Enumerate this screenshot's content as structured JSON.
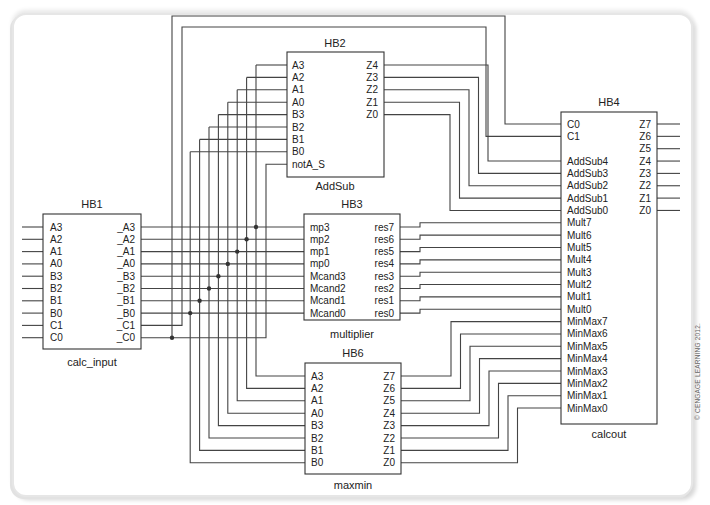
{
  "header": {
    "figure_title": "FIGURE 13-1 Final Schematic"
  },
  "copyright": "© CENGAGE LEARNING 2012.",
  "blocks": {
    "hb1": {
      "id": "HB1",
      "name": "calc_input",
      "inputs": [
        "A3",
        "A2",
        "A1",
        "A0",
        "B3",
        "B2",
        "B1",
        "B0",
        "C1",
        "C0"
      ],
      "outputs": [
        "_A3",
        "_A2",
        "_A1",
        "_A0",
        "_B3",
        "_B2",
        "_B1",
        "_B0",
        "_C1",
        "_C0"
      ]
    },
    "hb2": {
      "id": "HB2",
      "name": "AddSub",
      "inputs": [
        "A3",
        "A2",
        "A1",
        "A0",
        "B3",
        "B2",
        "B1",
        "B0",
        "notA_S"
      ],
      "outputs": [
        "Z4",
        "Z3",
        "Z2",
        "Z1",
        "Z0"
      ]
    },
    "hb3": {
      "id": "HB3",
      "name": "multiplier",
      "inputs": [
        "mp3",
        "mp2",
        "mp1",
        "mp0",
        "Mcand3",
        "Mcand2",
        "Mcand1",
        "Mcand0"
      ],
      "outputs": [
        "res7",
        "res6",
        "res5",
        "res4",
        "res3",
        "res2",
        "res1",
        "res0"
      ]
    },
    "hb6": {
      "id": "HB6",
      "name": "maxmin",
      "inputs": [
        "A3",
        "A2",
        "A1",
        "A0",
        "B3",
        "B2",
        "B1",
        "B0"
      ],
      "outputs": [
        "Z7",
        "Z6",
        "Z5",
        "Z4",
        "Z3",
        "Z2",
        "Z1",
        "Z0"
      ]
    },
    "hb4": {
      "id": "HB4",
      "name": "calcout",
      "inputs": [
        "C0",
        "C1",
        "",
        "AddSub4",
        "AddSub3",
        "AddSub2",
        "AddSub1",
        "AddSub0",
        "Mult7",
        "Mult6",
        "Mult5",
        "Mult4",
        "Mult3",
        "Mult2",
        "Mult1",
        "Mult0",
        "MinMax7",
        "MinMax6",
        "MinMax5",
        "MinMax4",
        "MinMax3",
        "MinMax2",
        "MinMax1",
        "MinMax0"
      ],
      "outputs": [
        "Z7",
        "Z6",
        "Z5",
        "Z4",
        "Z3",
        "Z2",
        "Z1",
        "Z0"
      ]
    }
  }
}
